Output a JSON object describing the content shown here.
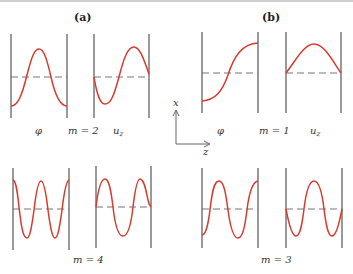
{
  "panels": {
    "a": {
      "label": "(a)",
      "modes": [
        {
          "m_label": "m = 2",
          "phi_label": "φ",
          "uz_label": "u",
          "uz_sub": "z"
        },
        {
          "m_label": "m = 4"
        }
      ]
    },
    "b": {
      "label": "(b)",
      "modes": [
        {
          "m_label": "m = 1",
          "phi_label": "φ",
          "uz_label": "u",
          "uz_sub": "z"
        },
        {
          "m_label": "m = 3"
        }
      ]
    }
  },
  "axes": {
    "vertical_label": "x",
    "horizontal_label": "z"
  },
  "colors": {
    "curve": "#d93a2f",
    "wall": "#555555",
    "dash": "#777777"
  }
}
